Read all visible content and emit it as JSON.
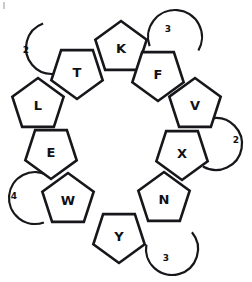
{
  "figure": {
    "background_color": "#ffffff",
    "stroke_color": "#17171b",
    "fill_color": "#ffffff",
    "width": 252,
    "height": 282
  },
  "chart_data": {
    "type": "diagram",
    "subtype": "pentagon-ring",
    "title": "",
    "nodes": [
      {
        "id": "K",
        "label": "K",
        "cx": 121,
        "cy": 48,
        "radius": 27,
        "rotation_deg": 0,
        "ring_position": 1,
        "angle_deg": 90
      },
      {
        "id": "F",
        "label": "F",
        "cx": 158,
        "cy": 74,
        "radius": 27,
        "rotation_deg": -36,
        "ring_position": 2,
        "angle_deg": 55
      },
      {
        "id": "V",
        "label": "V",
        "cx": 195,
        "cy": 105,
        "radius": 27,
        "rotation_deg": -72,
        "ring_position": 3,
        "angle_deg": 22
      },
      {
        "id": "X",
        "label": "X",
        "cx": 182,
        "cy": 153,
        "radius": 27,
        "rotation_deg": -108,
        "ring_position": 4,
        "angle_deg": -20
      },
      {
        "id": "N",
        "label": "N",
        "cx": 164,
        "cy": 199,
        "radius": 27,
        "rotation_deg": -144,
        "ring_position": 5,
        "angle_deg": -55
      },
      {
        "id": "Y",
        "label": "Y",
        "cx": 119,
        "cy": 236,
        "radius": 27,
        "rotation_deg": 180,
        "ring_position": 6,
        "angle_deg": -90
      },
      {
        "id": "W",
        "label": "W",
        "cx": 68,
        "cy": 200,
        "radius": 27,
        "rotation_deg": 144,
        "ring_position": 7,
        "angle_deg": -125
      },
      {
        "id": "E",
        "label": "E",
        "cx": 51,
        "cy": 152,
        "radius": 27,
        "rotation_deg": 108,
        "ring_position": 8,
        "angle_deg": -160
      },
      {
        "id": "L",
        "label": "L",
        "cx": 38,
        "cy": 105,
        "radius": 27,
        "rotation_deg": 72,
        "ring_position": 9,
        "angle_deg": 160
      },
      {
        "id": "T",
        "label": "T",
        "cx": 77,
        "cy": 72,
        "radius": 27,
        "rotation_deg": 36,
        "ring_position": 10,
        "angle_deg": 125
      }
    ],
    "letters_in_ring_order": [
      "K",
      "F",
      "V",
      "X",
      "N",
      "Y",
      "W",
      "E",
      "L",
      "T"
    ],
    "node_count": 10,
    "arc_annotations": [
      {
        "id": "arc-top-left",
        "label": "2",
        "cx": 52,
        "cy": 48,
        "r": 26,
        "start_deg": 110,
        "sweep_deg": 220,
        "label_x": 26,
        "label_y": 50
      },
      {
        "id": "arc-top-right",
        "label": "3",
        "cx": 175,
        "cy": 37,
        "r": 27,
        "start_deg": 330,
        "sweep_deg": 230,
        "label_x": 168,
        "label_y": 29
      },
      {
        "id": "arc-right",
        "label": "2",
        "cx": 216,
        "cy": 144,
        "r": 26,
        "start_deg": 240,
        "sweep_deg": 220,
        "label_x": 236,
        "label_y": 140
      },
      {
        "id": "arc-bottom-right",
        "label": "3",
        "cx": 172,
        "cy": 249,
        "r": 26,
        "start_deg": 170,
        "sweep_deg": 230,
        "label_x": 166,
        "label_y": 258
      },
      {
        "id": "arc-bottom-left",
        "label": "4",
        "cx": 35,
        "cy": 198,
        "r": 26,
        "start_deg": 60,
        "sweep_deg": 230,
        "label_x": 14,
        "label_y": 196
      }
    ],
    "arc_labels": [
      "2",
      "3",
      "2",
      "3",
      "4"
    ],
    "legend": [],
    "xlabel": "",
    "ylabel": "",
    "grid": false
  }
}
